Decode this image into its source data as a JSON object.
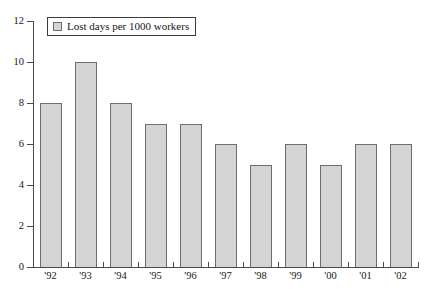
{
  "chart_data": {
    "type": "bar",
    "title": "",
    "subtitle": "",
    "xlabel": "",
    "ylabel": "",
    "categories": [
      "'92",
      "'93",
      "'94",
      "'95",
      "'96",
      "'97",
      "'98",
      "'99",
      "'00",
      "'01",
      "'02"
    ],
    "values": [
      8,
      10,
      8,
      7,
      7,
      6,
      5,
      6,
      5,
      6,
      6
    ],
    "series": [
      {
        "name": "Lost days per 1000 workers",
        "values": [
          8,
          10,
          8,
          7,
          7,
          6,
          5,
          6,
          5,
          6,
          6
        ]
      }
    ],
    "ylim": [
      0,
      12
    ],
    "ytick_values": [
      0,
      2,
      4,
      6,
      8,
      10,
      12
    ],
    "ytick_labels": [
      "0",
      "2",
      "4",
      "6",
      "8",
      "10",
      "12"
    ],
    "grid": false,
    "legend": {
      "position": "top-left",
      "entries": [
        {
          "label": "Lost days per 1000 workers",
          "swatch_color": "#d4d4d4"
        }
      ]
    },
    "colors": {
      "bar_fill": "#d4d4d4",
      "bar_border": "#6e6e6e",
      "axis": "#4a4a4a",
      "text": "#161616",
      "background": "#ffffff"
    }
  }
}
